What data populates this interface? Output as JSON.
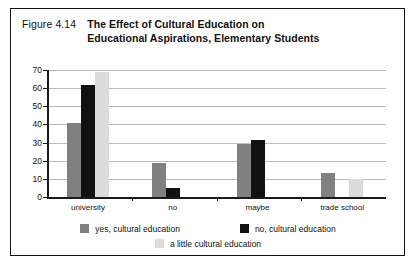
{
  "figure": {
    "number": "Figure 4.14",
    "title_line1": "The Effect of Cultural Education on",
    "title_line2": "Educational Aspirations, Elementary Students"
  },
  "colors": {
    "series_yes": "#808080",
    "series_no": "#111111",
    "series_little": "#dcdcdc",
    "axis": "#1a1a1a",
    "gridline": "#b9b9b9",
    "border": "#111111",
    "text": "#111111"
  },
  "chart_data": {
    "type": "bar",
    "title": "The Effect of Cultural Education on Educational Aspirations, Elementary Students",
    "xlabel": "",
    "ylabel": "",
    "ylim": [
      0,
      70
    ],
    "yticks": [
      0,
      10,
      20,
      30,
      40,
      50,
      60,
      70
    ],
    "ytick_labels": [
      "0",
      "10",
      "20",
      "30",
      "40",
      "50",
      "60",
      "70"
    ],
    "grid": true,
    "legend_position": "bottom",
    "categories": [
      "university",
      "no",
      "maybe",
      "trade school"
    ],
    "series": [
      {
        "name": "yes, cultural education",
        "color": "#808080",
        "values": [
          41,
          19,
          29,
          13
        ]
      },
      {
        "name": "no, cultural education",
        "color": "#111111",
        "values": [
          62,
          5,
          31.5,
          0
        ]
      },
      {
        "name": "a little cultural education",
        "color": "#dcdcdc",
        "values": [
          69,
          0,
          0,
          10
        ]
      }
    ]
  },
  "legend": {
    "entries": [
      {
        "label": "yes, cultural education",
        "color": "#808080"
      },
      {
        "label": "no, cultural education",
        "color": "#111111"
      },
      {
        "label": "a little cultural education",
        "color": "#dcdcdc"
      }
    ]
  }
}
